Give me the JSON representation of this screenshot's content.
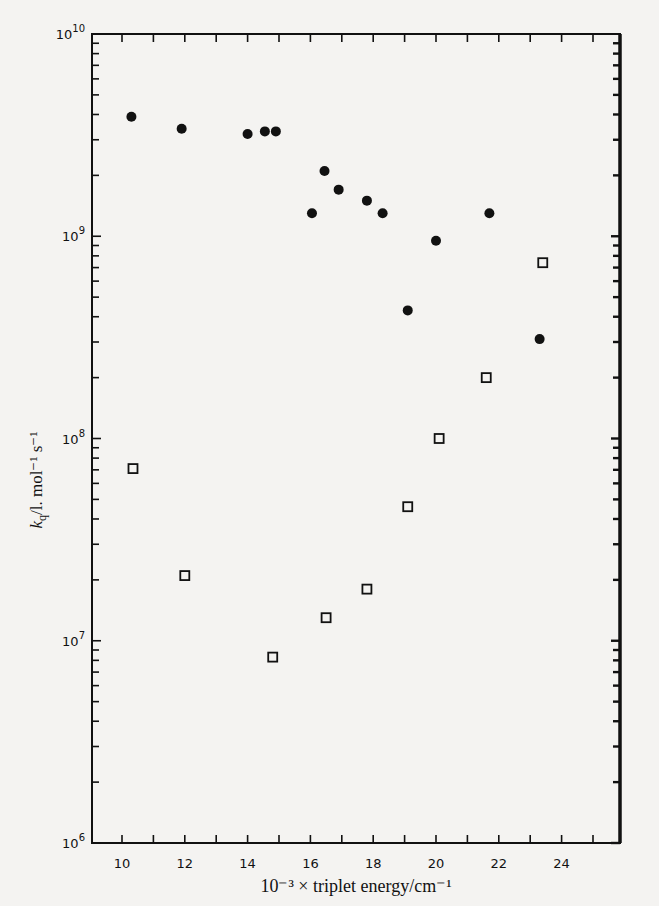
{
  "chart_data": {
    "type": "scatter",
    "title": "",
    "xlabel": "10⁻³ × triplet energy/cm⁻¹",
    "ylabel": "k_q/l. mol⁻¹ s⁻¹",
    "yscale": "log",
    "xlim": [
      9.3,
      26.0
    ],
    "ylim": [
      1000000.0,
      10000000000.0
    ],
    "x_ticks": [
      10,
      11,
      12,
      13,
      14,
      15,
      16,
      17,
      18,
      19,
      20,
      21,
      22,
      23,
      24,
      25
    ],
    "x_tick_labels": [
      "10",
      "12",
      "14",
      "16",
      "18",
      "20",
      "22",
      "24"
    ],
    "y_tick_labels": [
      {
        "base": "10",
        "exp": "6",
        "value": 1000000.0
      },
      {
        "base": "10",
        "exp": "7",
        "value": 10000000.0
      },
      {
        "base": "10",
        "exp": "8",
        "value": 100000000.0
      },
      {
        "base": "10",
        "exp": "9",
        "value": 1000000000.0
      },
      {
        "base": "10",
        "exp": "10",
        "value": 10000000000.0
      }
    ],
    "grid": false,
    "legend": "none",
    "series": [
      {
        "name": "filled circles",
        "marker": "filled-circle",
        "points": [
          {
            "x": 10.3,
            "y": 3900000000.0
          },
          {
            "x": 11.9,
            "y": 3400000000.0
          },
          {
            "x": 14.0,
            "y": 3200000000.0
          },
          {
            "x": 14.55,
            "y": 3300000000.0
          },
          {
            "x": 14.9,
            "y": 3300000000.0
          },
          {
            "x": 16.05,
            "y": 1300000000.0
          },
          {
            "x": 16.45,
            "y": 2100000000.0
          },
          {
            "x": 16.9,
            "y": 1700000000.0
          },
          {
            "x": 17.8,
            "y": 1500000000.0
          },
          {
            "x": 18.3,
            "y": 1300000000.0
          },
          {
            "x": 19.1,
            "y": 430000000.0
          },
          {
            "x": 20.0,
            "y": 950000000.0
          },
          {
            "x": 21.7,
            "y": 1300000000.0
          },
          {
            "x": 23.3,
            "y": 310000000.0
          }
        ]
      },
      {
        "name": "open squares",
        "marker": "open-square",
        "points": [
          {
            "x": 10.35,
            "y": 71000000.0
          },
          {
            "x": 12.0,
            "y": 21000000.0
          },
          {
            "x": 14.8,
            "y": 8300000.0
          },
          {
            "x": 16.5,
            "y": 13000000.0
          },
          {
            "x": 17.8,
            "y": 18000000.0
          },
          {
            "x": 19.1,
            "y": 46000000.0
          },
          {
            "x": 20.1,
            "y": 100000000.0
          },
          {
            "x": 21.6,
            "y": 200000000.0
          },
          {
            "x": 23.4,
            "y": 740000000.0
          }
        ]
      }
    ]
  },
  "colors": {
    "ink": "#111111",
    "paper": "#f4f3f1"
  }
}
